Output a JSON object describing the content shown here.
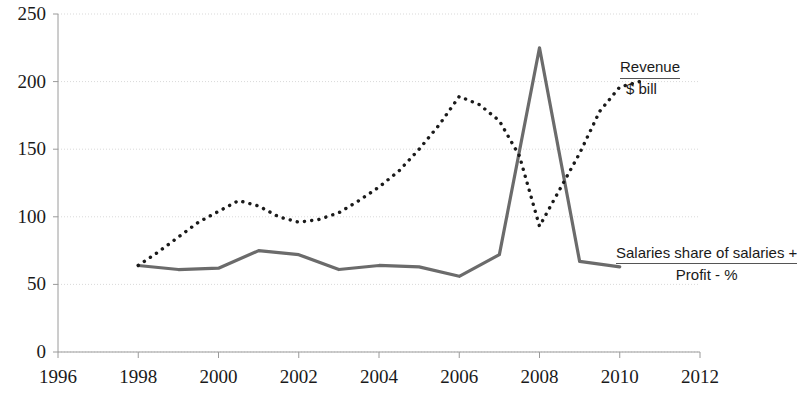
{
  "chart_data": {
    "type": "line",
    "title": "",
    "xlabel": "",
    "ylabel": "",
    "xlim": [
      1996,
      2012
    ],
    "ylim": [
      0,
      250
    ],
    "ytick_values": [
      0,
      50,
      100,
      150,
      200,
      250
    ],
    "ytick_labels": [
      "0",
      "50",
      "100",
      "150",
      "200",
      "250"
    ],
    "xtick_values": [
      1996,
      1998,
      2000,
      2002,
      2004,
      2006,
      2008,
      2010,
      2012
    ],
    "xtick_labels": [
      "1996",
      "1998",
      "2000",
      "2002",
      "2004",
      "2006",
      "2008",
      "2010",
      "2012"
    ],
    "grid": true,
    "grid_axis": "y",
    "legend": "annotations-at-right",
    "series": [
      {
        "name": "Revenue $ bill",
        "style": "dotted",
        "color": "#1a1a1a",
        "x": [
          1998,
          1998.5,
          1999,
          1999.5,
          2000,
          2000.5,
          2001,
          2001.5,
          2002,
          2002.5,
          2003,
          2003.5,
          2004,
          2004.5,
          2005,
          2005.5,
          2006,
          2006.5,
          2007,
          2007.5,
          2008,
          2008.5,
          2009,
          2009.5,
          2010,
          2010.5
        ],
        "values": [
          64,
          74,
          85,
          96,
          104,
          112,
          108,
          100,
          96,
          98,
          103,
          112,
          122,
          134,
          150,
          168,
          189,
          183,
          171,
          145,
          93,
          120,
          147,
          178,
          196,
          200
        ]
      },
      {
        "name": "Salaries share of salaries + Profit - %",
        "style": "solid",
        "color": "#5a5a5a",
        "x": [
          1998,
          1999,
          2000,
          2001,
          2002,
          2003,
          2004,
          2005,
          2006,
          2007,
          2008,
          2009,
          2010
        ],
        "values": [
          64,
          61,
          62,
          75,
          72,
          61,
          64,
          63,
          56,
          72,
          225,
          67,
          63
        ]
      }
    ],
    "annotations": [
      {
        "id": "revenue-label",
        "line1": "Revenue",
        "line2": "$ bill",
        "underline_after_line1": true
      },
      {
        "id": "salaries-label",
        "line1": "Salaries share",
        "line2": "of salaries +",
        "line3": "Profit - %",
        "overline_before_line3": true
      }
    ]
  },
  "axis": {
    "y_labels": [
      "250",
      "200",
      "150",
      "100",
      "50",
      "0"
    ],
    "x_labels": [
      "1996",
      "1998",
      "2000",
      "2002",
      "2004",
      "2006",
      "2008",
      "2010",
      "2012"
    ]
  },
  "colors": {
    "axis": "#9a9a9a",
    "grid": "#d9d9d9",
    "series_dotted": "#1a1a1a",
    "series_solid": "#6b6b6b",
    "text": "#1a1a1a",
    "background": "#ffffff"
  },
  "annotations": {
    "revenue": {
      "line1": "Revenue",
      "line2": "$ bill"
    },
    "salaries": {
      "line1": "Salaries share",
      "line2": "of salaries +",
      "line3": "Profit - %"
    }
  }
}
